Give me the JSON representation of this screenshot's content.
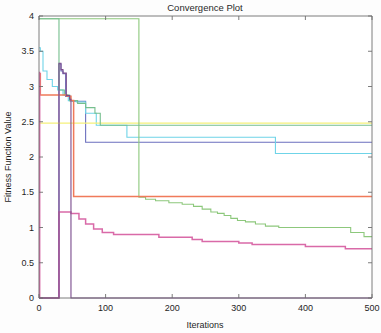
{
  "chart_data": {
    "type": "line",
    "title": "Convergence Plot",
    "xlabel": "Iterations",
    "ylabel": "Fitness Function Value",
    "xlim": [
      0,
      500
    ],
    "ylim": [
      0,
      4
    ],
    "xticks": [
      0,
      100,
      200,
      300,
      400,
      500
    ],
    "xtick_labels": [
      "0",
      "100",
      "200",
      "300",
      "400",
      "500"
    ],
    "yticks": [
      0,
      0.5,
      1,
      1.5,
      2,
      2.5,
      3,
      3.5,
      4
    ],
    "ytick_labels": [
      "0",
      "0.5",
      "1",
      "1.5",
      "2",
      "2.5",
      "3",
      "3.5",
      "4"
    ],
    "grid": false,
    "legend": null,
    "legend_position": "none",
    "series": [
      {
        "name": "series-1-blue",
        "color": "#6b6fbe",
        "x": [
          0,
          30,
          30,
          33,
          33,
          36,
          36,
          40,
          40,
          47,
          47,
          50,
          50,
          70,
          70,
          500
        ],
        "y": [
          0,
          0,
          3.32,
          3.32,
          3.22,
          3.22,
          3.18,
          3.18,
          2.86,
          2.86,
          2.8,
          2.8,
          2.79,
          2.79,
          2.21,
          2.21
        ]
      },
      {
        "name": "series-2-cyan",
        "color": "#6fd4e8",
        "x": [
          0,
          2,
          2,
          6,
          6,
          12,
          12,
          20,
          20,
          28,
          28,
          36,
          36,
          44,
          44,
          56,
          56,
          70,
          70,
          86,
          86,
          132,
          132,
          355,
          355,
          500
        ],
        "y": [
          3.55,
          3.55,
          3.5,
          3.5,
          3.22,
          3.22,
          3.1,
          3.1,
          3.0,
          3.0,
          2.95,
          2.95,
          2.88,
          2.88,
          2.8,
          2.8,
          2.78,
          2.78,
          2.62,
          2.62,
          2.45,
          2.45,
          2.28,
          2.28,
          2.05,
          2.05
        ]
      },
      {
        "name": "series-3-yellow",
        "color": "#f5f07a",
        "x": [
          0,
          500
        ],
        "y": [
          2.48,
          2.48
        ]
      },
      {
        "name": "series-4-green-top",
        "color": "#8dc87c",
        "x": [
          0,
          150,
          150,
          160,
          160,
          175,
          175,
          195,
          195,
          215,
          215,
          232,
          232,
          245,
          245,
          258,
          258,
          268,
          268,
          278,
          278,
          288,
          288,
          298,
          298,
          310,
          310,
          325,
          325,
          340,
          340,
          360,
          360,
          468,
          468,
          488,
          488,
          500
        ],
        "y": [
          3.96,
          3.96,
          1.43,
          1.43,
          1.4,
          1.4,
          1.38,
          1.38,
          1.35,
          1.35,
          1.33,
          1.33,
          1.3,
          1.3,
          1.26,
          1.26,
          1.22,
          1.22,
          1.2,
          1.2,
          1.17,
          1.17,
          1.13,
          1.13,
          1.1,
          1.1,
          1.08,
          1.08,
          1.05,
          1.05,
          1.02,
          1.02,
          1.0,
          1.0,
          0.93,
          0.93,
          0.87,
          0.87
        ]
      },
      {
        "name": "series-5-seagreen",
        "color": "#76bf8e",
        "x": [
          0,
          30,
          30,
          38,
          38,
          46,
          46,
          58,
          58,
          70,
          70,
          84,
          84,
          92,
          92,
          500
        ],
        "y": [
          3.96,
          3.96,
          2.95,
          2.95,
          2.88,
          2.88,
          2.8,
          2.8,
          2.76,
          2.76,
          2.7,
          2.7,
          2.62,
          2.62,
          2.45,
          2.45
        ]
      },
      {
        "name": "series-6-orange",
        "color": "#f07a5a",
        "x": [
          0,
          2,
          2,
          42,
          42,
          48,
          48,
          52,
          52,
          500
        ],
        "y": [
          3.18,
          3.18,
          2.88,
          2.88,
          2.86,
          2.86,
          2.8,
          2.8,
          1.44,
          1.44
        ]
      },
      {
        "name": "series-7-magenta",
        "color": "#d96aa8",
        "x": [
          0,
          1,
          1,
          30,
          30,
          48,
          48,
          60,
          60,
          70,
          70,
          82,
          82,
          95,
          95,
          112,
          112,
          180,
          180,
          230,
          230,
          245,
          245,
          300,
          300,
          320,
          320,
          400,
          400,
          460,
          460,
          500
        ],
        "y": [
          3.2,
          3.2,
          0,
          0,
          1.22,
          1.22,
          1.2,
          1.2,
          1.12,
          1.12,
          1.05,
          1.05,
          0.98,
          0.98,
          0.93,
          0.93,
          0.9,
          0.9,
          0.86,
          0.86,
          0.83,
          0.83,
          0.8,
          0.8,
          0.78,
          0.78,
          0.76,
          0.76,
          0.73,
          0.73,
          0.7,
          0.7
        ]
      },
      {
        "name": "series-8-darkviolet",
        "color": "#7a4b8c",
        "x": [
          0,
          30,
          30,
          33,
          33,
          36,
          36,
          41,
          41,
          46,
          46,
          48,
          48,
          500
        ],
        "y": [
          0,
          0,
          3.33,
          3.33,
          3.24,
          3.24,
          3.19,
          3.19,
          2.87,
          2.87,
          2.82,
          2.82,
          0,
          0
        ]
      }
    ]
  }
}
